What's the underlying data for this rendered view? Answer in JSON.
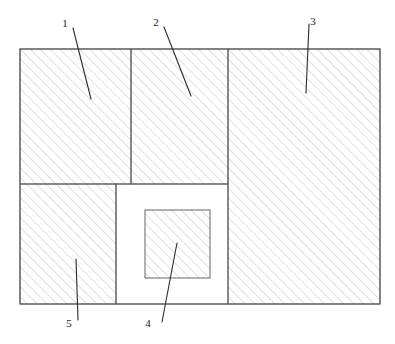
{
  "figure": {
    "background_color": "#ffffff",
    "outline_color": "#555555",
    "hatch_color": "#b8b8b8",
    "leader_color": "#2b2b2b",
    "canvas": {
      "width": 395,
      "height": 344
    },
    "boundary": {
      "x": 20,
      "y": 49,
      "width": 360,
      "height": 255
    }
  },
  "regions": [
    {
      "id": "region-1",
      "ref": "1",
      "hatched": true,
      "x": 20,
      "y": 49,
      "width": 111,
      "height": 135
    },
    {
      "id": "region-2",
      "ref": "2",
      "hatched": true,
      "x": 131,
      "y": 49,
      "width": 97,
      "height": 135
    },
    {
      "id": "region-3",
      "ref": "3",
      "hatched": true,
      "x": 228,
      "y": 49,
      "width": 152,
      "height": 255
    },
    {
      "id": "region-5",
      "ref": "5",
      "hatched": true,
      "x": 20,
      "y": 184,
      "width": 96,
      "height": 120
    },
    {
      "id": "cavity",
      "ref": "",
      "hatched": false,
      "x": 116,
      "y": 184,
      "width": 112,
      "height": 120
    },
    {
      "id": "region-4",
      "ref": "4",
      "hatched": true,
      "x": 145,
      "y": 210,
      "width": 65,
      "height": 68
    }
  ],
  "callouts": [
    {
      "id": "callout-1",
      "label": "1",
      "label_x": 65,
      "label_y": 27,
      "line": {
        "x1": 73,
        "y1": 28,
        "x2": 91,
        "y2": 99
      }
    },
    {
      "id": "callout-2",
      "label": "2",
      "label_x": 156,
      "label_y": 26,
      "line": {
        "x1": 164,
        "y1": 27,
        "x2": 191,
        "y2": 96
      }
    },
    {
      "id": "callout-3",
      "label": "3",
      "label_x": 313,
      "label_y": 25,
      "line": {
        "x1": 309,
        "y1": 24,
        "x2": 306,
        "y2": 93
      }
    },
    {
      "id": "callout-4",
      "label": "4",
      "label_x": 148,
      "label_y": 327,
      "line": {
        "x1": 162,
        "y1": 322,
        "x2": 177,
        "y2": 243
      }
    },
    {
      "id": "callout-5",
      "label": "5",
      "label_x": 69,
      "label_y": 327,
      "line": {
        "x1": 78,
        "y1": 320,
        "x2": 76,
        "y2": 259
      }
    }
  ]
}
